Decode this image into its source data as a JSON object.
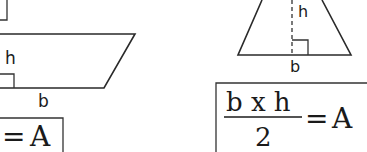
{
  "parallelogram": {
    "height_label": "h",
    "base_label": "b"
  },
  "parallelogram_formula": {
    "equals": "=",
    "result": "A"
  },
  "triangle": {
    "height_label": "h",
    "base_label": "b"
  },
  "triangle_formula": {
    "numerator": "b x h",
    "denominator": "2",
    "equals": "=",
    "result": "A"
  }
}
